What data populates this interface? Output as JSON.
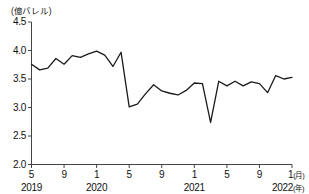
{
  "chart_data": {
    "type": "line",
    "title": "",
    "subtitle": "",
    "xlabel": "",
    "ylabel": "(億バレル)",
    "unit_label": "(億バレル)",
    "ylim": [
      2.0,
      4.5
    ],
    "xlim": [
      "2019-05",
      "2022-01"
    ],
    "grid": false,
    "legend": null,
    "y_ticks": [
      "4.5",
      "4.0",
      "3.5",
      "3.0",
      "2.5",
      "2.0"
    ],
    "y_tick_values": [
      4.5,
      4.0,
      3.5,
      3.0,
      2.5,
      2.0
    ],
    "x_ticks": [
      {
        "label": "5",
        "month": "2019-05"
      },
      {
        "label": "9",
        "month": "2019-09"
      },
      {
        "label": "1",
        "month": "2020-01"
      },
      {
        "label": "5",
        "month": "2020-05"
      },
      {
        "label": "9",
        "month": "2020-09"
      },
      {
        "label": "1",
        "month": "2021-01"
      },
      {
        "label": "5",
        "month": "2021-05"
      },
      {
        "label": "9",
        "month": "2021-09"
      },
      {
        "label": "1",
        "month": "2022-01",
        "suffix": "(月)"
      }
    ],
    "x_year_ticks": [
      {
        "label": "2019",
        "month": "2019-05"
      },
      {
        "label": "2020",
        "month": "2020-01"
      },
      {
        "label": "2021",
        "month": "2021-01"
      },
      {
        "label": "2022",
        "month": "2022-01",
        "suffix": "(年)"
      }
    ],
    "series": [
      {
        "name": "原油輸入量",
        "color": "#1a1a1a",
        "x": [
          "2019-05",
          "2019-06",
          "2019-07",
          "2019-08",
          "2019-09",
          "2019-10",
          "2019-11",
          "2019-12",
          "2020-01",
          "2020-02",
          "2020-03",
          "2020-04",
          "2020-05",
          "2020-06",
          "2020-07",
          "2020-08",
          "2020-09",
          "2020-10",
          "2020-11",
          "2020-12",
          "2021-01",
          "2021-02",
          "2021-03",
          "2021-04",
          "2021-05",
          "2021-06",
          "2021-07",
          "2021-08",
          "2021-09",
          "2021-10",
          "2021-11",
          "2021-12",
          "2022-01"
        ],
        "values": [
          3.76,
          3.66,
          3.69,
          3.86,
          3.76,
          3.91,
          3.88,
          3.94,
          3.99,
          3.92,
          3.72,
          3.97,
          3.01,
          3.06,
          3.24,
          3.4,
          3.29,
          3.25,
          3.22,
          3.3,
          3.43,
          3.42,
          2.74,
          3.46,
          3.38,
          3.46,
          3.38,
          3.45,
          3.42,
          3.26,
          3.56,
          3.5,
          3.53
        ]
      }
    ]
  }
}
